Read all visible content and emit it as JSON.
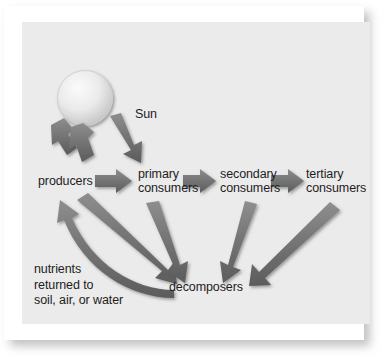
{
  "figure": {
    "type": "energy-flow-diagram",
    "background_color": "#ebebeb",
    "page_color": "#ffffff",
    "arrow_color": "#6e6e6e",
    "arrow_highlight_color": "#8d8d8d",
    "arrow_shadow_color": "#4f4f4f",
    "text_color": "#1d1d1d",
    "sun_color_center": "#f2f2f2",
    "sun_color_edge": "#c9c9c9"
  },
  "nodes": {
    "sun": {
      "label": "Sun"
    },
    "producers": {
      "label": "producers"
    },
    "primary_consumers": {
      "line1": "primary",
      "line2": "consumers"
    },
    "secondary_consumers": {
      "line1": "secondary",
      "line2": "consumers"
    },
    "tertiary_consumers": {
      "line1": "tertiary",
      "line2": "consumers"
    },
    "decomposers": {
      "label": "decomposers"
    },
    "nutrients": {
      "line1": "nutrients",
      "line2": "returned to",
      "line3": "soil, air, or water"
    }
  },
  "arrows": [
    {
      "name": "sun-to-producers-left",
      "from": "sun",
      "to": "producers",
      "style": "straight"
    },
    {
      "name": "sun-to-producers-center",
      "from": "sun",
      "to": "producers",
      "style": "straight"
    },
    {
      "name": "sun-to-primary-consumers",
      "from": "sun",
      "to": "primary_consumers",
      "style": "straight"
    },
    {
      "name": "producers-to-primary",
      "from": "producers",
      "to": "primary_consumers",
      "style": "straight"
    },
    {
      "name": "primary-to-secondary",
      "from": "primary_consumers",
      "to": "secondary_consumers",
      "style": "straight"
    },
    {
      "name": "secondary-to-tertiary",
      "from": "secondary_consumers",
      "to": "tertiary_consumers",
      "style": "straight"
    },
    {
      "name": "producers-to-decomposers",
      "from": "producers",
      "to": "decomposers",
      "style": "straight"
    },
    {
      "name": "primary-to-decomposers",
      "from": "primary_consumers",
      "to": "decomposers",
      "style": "straight"
    },
    {
      "name": "secondary-to-decomposers",
      "from": "secondary_consumers",
      "to": "decomposers",
      "style": "straight"
    },
    {
      "name": "tertiary-to-decomposers",
      "from": "tertiary_consumers",
      "to": "decomposers",
      "style": "straight"
    },
    {
      "name": "decomposers-to-producers",
      "from": "decomposers",
      "to": "producers",
      "style": "curved"
    }
  ]
}
